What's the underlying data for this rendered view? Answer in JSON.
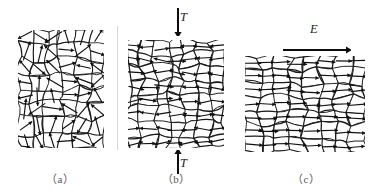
{
  "figure": {
    "width": 377,
    "height": 196,
    "background_color": "#ffffff",
    "grain_line_color": "#1a1a1a",
    "arrow_color": "#111111",
    "divider_color": "#d8d8d8"
  },
  "dividers": [
    {
      "name": "divider-a-b",
      "x": 117,
      "y": 26,
      "height": 124
    }
  ],
  "panels": [
    {
      "id": "a",
      "caption": "（a）",
      "caption_x": 60,
      "caption_y": 170,
      "state": "random-orientation",
      "x": 18,
      "y": 30,
      "width": 86,
      "height": 118,
      "cols": 6,
      "rows": 8,
      "seed": 17,
      "orientation_mode": "random",
      "arrow_color": "#111111",
      "field_label": null,
      "load_arrows": []
    },
    {
      "id": "b",
      "caption": "（b）",
      "caption_x": 176,
      "caption_y": 170,
      "state": "ferroelastic-switching-under-stress",
      "x": 128,
      "y": 40,
      "width": 96,
      "height": 108,
      "cols": 7,
      "rows": 8,
      "seed": 43,
      "orientation_mode": "horizontal-biased",
      "arrow_color": "#111111",
      "field_label": {
        "text": "T",
        "symbol": "T",
        "meaning": "compressive stress"
      },
      "load_arrows": [
        {
          "name": "stress-arrow-top",
          "direction": "down",
          "x": 172,
          "y": 8,
          "length": 28,
          "label": "T",
          "label_x": 180,
          "label_y": 10
        },
        {
          "name": "stress-arrow-bottom",
          "direction": "up",
          "x": 172,
          "y": 150,
          "length": 24,
          "label": "T",
          "label_x": 180,
          "label_y": 156
        }
      ]
    },
    {
      "id": "c",
      "caption": "（c）",
      "caption_x": 306,
      "caption_y": 170,
      "state": "poled-aligned-with-field",
      "x": 245,
      "y": 56,
      "width": 120,
      "height": 96,
      "cols": 8,
      "rows": 7,
      "seed": 91,
      "orientation_mode": "aligned-right",
      "arrow_color": "#111111",
      "field_label": {
        "text": "E",
        "symbol": "E",
        "meaning": "applied electric field"
      },
      "load_arrows": [
        {
          "name": "field-arrow-e",
          "direction": "right",
          "x": 283,
          "y": 42,
          "length": 68,
          "label": "E",
          "label_x": 310,
          "label_y": 22
        }
      ]
    }
  ]
}
